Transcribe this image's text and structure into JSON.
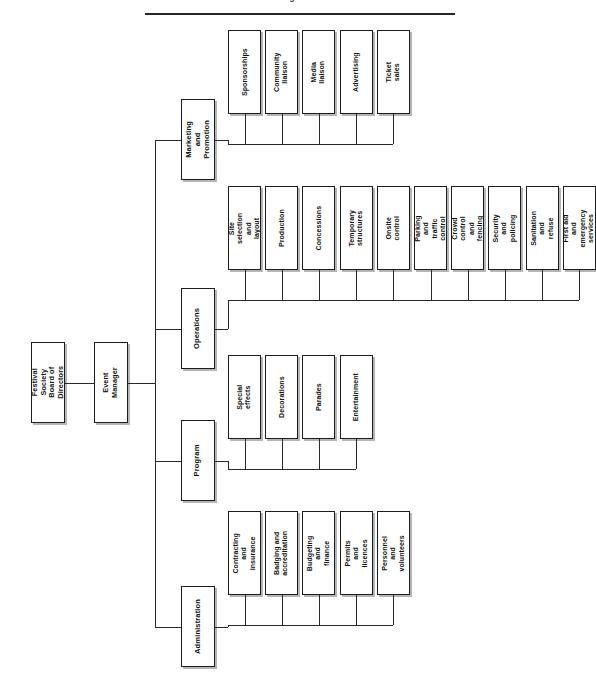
{
  "document": {
    "caption_fragment": "Figure",
    "rule_color": "#262626"
  },
  "chart_data": {
    "type": "diagram",
    "diagram_type": "organisational-chart",
    "orientation": "rotated-90-counterclockwise",
    "title": "",
    "root": {
      "label": "Festival Society\nBoard of Directors"
    },
    "manager": {
      "label": "Event Manager"
    },
    "departments": [
      {
        "label": "Administration",
        "units": [
          {
            "label": "Contracting and\ninsurance"
          },
          {
            "label": "Badging and\naccreditation"
          },
          {
            "label": "Budgeting and\nfinance"
          },
          {
            "label": "Permits and\nlicences"
          },
          {
            "label": "Personnel and\nvolunteers"
          }
        ]
      },
      {
        "label": "Program",
        "units": [
          {
            "label": "Special effects"
          },
          {
            "label": "Decorations"
          },
          {
            "label": "Parades"
          },
          {
            "label": "Entertainment"
          }
        ]
      },
      {
        "label": "Operations",
        "units": [
          {
            "label": "Site selection and\nlayout"
          },
          {
            "label": "Production"
          },
          {
            "label": "Concessions"
          },
          {
            "label": "Temporary\nstructures"
          },
          {
            "label": "Onsite control"
          },
          {
            "label": "Parking and\ntraffic control"
          },
          {
            "label": "Crowd control and\nfencing"
          },
          {
            "label": "Security and\npolicing"
          },
          {
            "label": "Sanitation and\nrefuse"
          },
          {
            "label": "First aid and\nemergency services"
          }
        ]
      },
      {
        "label": "Marketing and\nPromotion",
        "units": [
          {
            "label": "Sponsorships"
          },
          {
            "label": "Community\nliaison"
          },
          {
            "label": "Media liaison"
          },
          {
            "label": "Advertising"
          },
          {
            "label": "Ticket sales"
          }
        ]
      }
    ],
    "colors": {
      "box_border": "#1d1d1d",
      "box_fill": "#ffffff",
      "line": "#2a2a2a",
      "text": "#111111",
      "shadow": "#787878"
    }
  }
}
